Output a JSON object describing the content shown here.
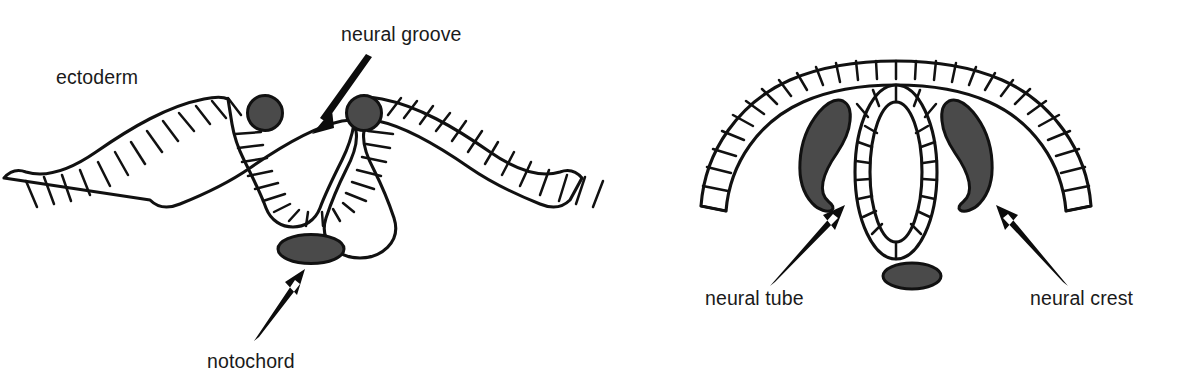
{
  "figure": {
    "background_color": "#ffffff",
    "line_color": "#111111",
    "fill_color": "#4a4a4a",
    "text_color": "#1a1a1a"
  },
  "panels": [
    {
      "id": "left",
      "name": "neural-groove-stage",
      "labels": [
        {
          "key": "ectoderm",
          "text": "ectoderm",
          "x": 56,
          "y": 84,
          "anchor": "start",
          "has_arrow": false
        },
        {
          "key": "neural_groove",
          "text": "neural groove",
          "x": 341,
          "y": 41,
          "anchor": "start",
          "has_arrow": true
        },
        {
          "key": "notochord",
          "text": "notochord",
          "x": 207,
          "y": 368,
          "anchor": "start",
          "has_arrow": true
        }
      ],
      "structures": [
        {
          "name": "ectoderm-sheet",
          "description": "epithelial sheet with cell boundaries, dipping into a U-shaped groove at center"
        },
        {
          "name": "neural-crest-cell-left",
          "description": "dark gray circle at left lip of groove"
        },
        {
          "name": "neural-crest-cell-right",
          "description": "dark gray circle at right lip of groove"
        },
        {
          "name": "notochord",
          "description": "dark gray horizontal ellipse beneath the groove"
        }
      ]
    },
    {
      "id": "right",
      "name": "neural-tube-stage",
      "labels": [
        {
          "key": "neural_tube",
          "text": "neural tube",
          "x": 705,
          "y": 305,
          "anchor": "start",
          "has_arrow": true
        },
        {
          "key": "neural_crest",
          "text": "neural crest",
          "x": 1030,
          "y": 305,
          "anchor": "start",
          "has_arrow": true
        }
      ],
      "structures": [
        {
          "name": "ectoderm-arch",
          "description": "arched epithelial sheet with cell boundaries over the neural tube"
        },
        {
          "name": "neural-tube",
          "description": "closed double-walled vertical ellipse with radial cell boundaries"
        },
        {
          "name": "neural-crest-left",
          "description": "dark gray comma-shaped mass left of the neural tube"
        },
        {
          "name": "neural-crest-right",
          "description": "dark gray comma-shaped mass right of the neural tube"
        },
        {
          "name": "notochord",
          "description": "dark gray horizontal ellipse beneath the neural tube"
        }
      ]
    }
  ]
}
